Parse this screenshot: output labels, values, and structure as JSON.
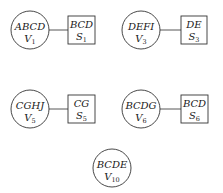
{
  "diagram": {
    "type": "junction-tree / clique-separator graph",
    "pairs": [
      {
        "clique": {
          "letters": "ABCD",
          "name": "V",
          "index": "1"
        },
        "separator": {
          "letters": "BCD",
          "name": "S",
          "index": "1"
        }
      },
      {
        "clique": {
          "letters": "DEFI",
          "name": "V",
          "index": "3"
        },
        "separator": {
          "letters": "DE",
          "name": "S",
          "index": "3"
        }
      },
      {
        "clique": {
          "letters": "CGHJ",
          "name": "V",
          "index": "5"
        },
        "separator": {
          "letters": "CG",
          "name": "S",
          "index": "5"
        }
      },
      {
        "clique": {
          "letters": "BCDG",
          "name": "V",
          "index": "6"
        },
        "separator": {
          "letters": "BCD",
          "name": "S",
          "index": "6"
        }
      }
    ],
    "standalone": {
      "clique": {
        "letters": "BCDE",
        "name": "V",
        "index": "10"
      }
    },
    "colors": {
      "stroke": "#333333",
      "text": "#1a1a1a",
      "background": "#ffffff"
    }
  }
}
